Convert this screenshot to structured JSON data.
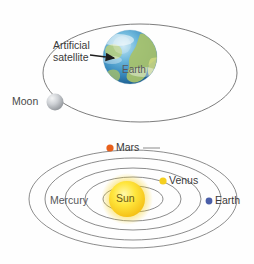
{
  "figure": {
    "background_color": "#fefefe",
    "orbit_line_color": "#6b6b6b"
  },
  "panel_earth_moon": {
    "name": "Earth and Moon orbit panel",
    "orbit": {
      "shape": "ellipse",
      "cx": 140,
      "cy": 73,
      "rx": 97,
      "ry": 49
    },
    "labels": {
      "artificial_satellite": "Artificial\nsatellite",
      "artificial_satellite_line1": "Artificial",
      "artificial_satellite_line2": "satellite",
      "earth": "Earth",
      "moon": "Moon"
    },
    "bodies": [
      {
        "name": "Earth",
        "cx": 130,
        "cy": 57,
        "r": 27,
        "color": "#2f7fb5"
      },
      {
        "name": "Moon",
        "cx": 55,
        "cy": 102,
        "r": 8,
        "color": "#b9bcc0"
      }
    ],
    "arrow": {
      "name": "satellite-pointer-arrow",
      "from_x": 90,
      "from_y": 55,
      "to_x": 116,
      "to_y": 58,
      "color": "#1d1d1d"
    }
  },
  "panel_solar_system": {
    "name": "Inner solar system panel",
    "sun": {
      "label": "Sun",
      "cx": 127,
      "cy": 199,
      "r": 18,
      "color_core": "#ffe84d",
      "color_edge": "#f6c517"
    },
    "orbits": [
      {
        "planet": "Mercury",
        "rx": 30,
        "ry": 13
      },
      {
        "planet": "Venus",
        "rx": 48,
        "ry": 22
      },
      {
        "planet": "Earth",
        "rx": 68,
        "ry": 31
      },
      {
        "planet": "Mars",
        "rx": 88,
        "ry": 41
      },
      {
        "planet": "Outer",
        "rx": 104,
        "ry": 49
      }
    ],
    "orbit_center": {
      "cx": 133,
      "cy": 199
    },
    "planets": [
      {
        "name": "Mars",
        "label": "Mars",
        "cx": 110,
        "cy": 148,
        "r": 3.6,
        "color": "#e8601c"
      },
      {
        "name": "Venus",
        "label": "Venus",
        "cx": 163,
        "cy": 181,
        "r": 3.6,
        "color": "#f5cf20"
      },
      {
        "name": "Earth",
        "label": "Earth",
        "cx": 209,
        "cy": 201,
        "r": 3.4,
        "color": "#4a5ea8"
      },
      {
        "name": "Mercury",
        "label": "Mercury",
        "cx": 104,
        "cy": 202,
        "r": 0,
        "color": "#999999"
      }
    ]
  }
}
